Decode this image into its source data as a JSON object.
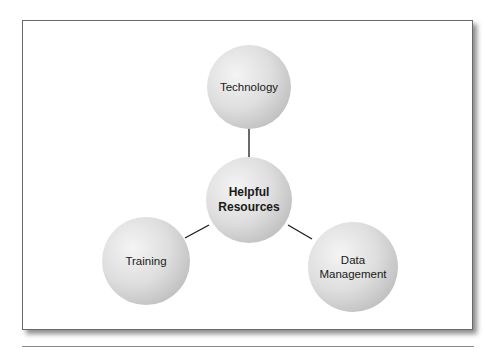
{
  "diagram": {
    "type": "hub-and-spoke",
    "center": {
      "label_line1": "Helpful",
      "label_line2": "Resources"
    },
    "nodes": [
      {
        "id": "technology",
        "label": "Technology"
      },
      {
        "id": "training",
        "label": "Training"
      },
      {
        "id": "data-management",
        "label_line1": "Data",
        "label_line2": "Management"
      }
    ],
    "colors": {
      "node_fill_light": "#f2f2f2",
      "node_fill_dark": "#c4c4c4",
      "connector": "#1a1a1a",
      "frame_border": "#6a6a6a"
    }
  }
}
